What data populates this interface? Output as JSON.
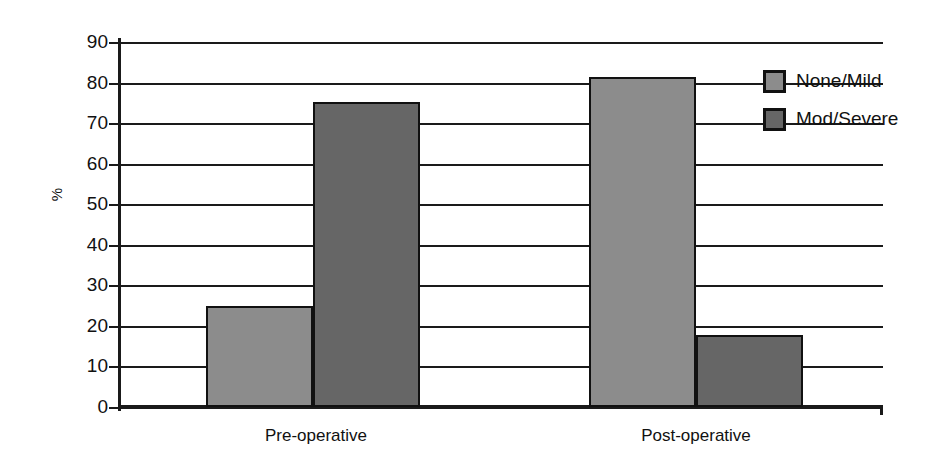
{
  "chart_data": {
    "type": "bar",
    "title": "",
    "xlabel": "",
    "ylabel": "%",
    "ylim": [
      0,
      90
    ],
    "ytick_step": 10,
    "grid": true,
    "legend_position": "right",
    "categories": [
      "Pre-operative",
      "Post-operative"
    ],
    "yticks": [
      "90",
      "80",
      "70",
      "60",
      "50",
      "40",
      "30",
      "20",
      "10",
      "0"
    ],
    "series": [
      {
        "name": "None/Mild",
        "color": "#8c8c8c",
        "values": [
          24.8,
          81.3
        ]
      },
      {
        "name": "Mod/Severe",
        "color": "#666666",
        "values": [
          75.2,
          17.8
        ]
      }
    ]
  },
  "legend": {
    "items": [
      {
        "label": "None/Mild",
        "swatch": "light"
      },
      {
        "label": "Mod/Severe",
        "swatch": "dark"
      }
    ]
  },
  "colors": {
    "light_gray": "#8c8c8c",
    "dark_gray": "#666666",
    "axis": "#1a1a1a",
    "background": "#ffffff"
  }
}
